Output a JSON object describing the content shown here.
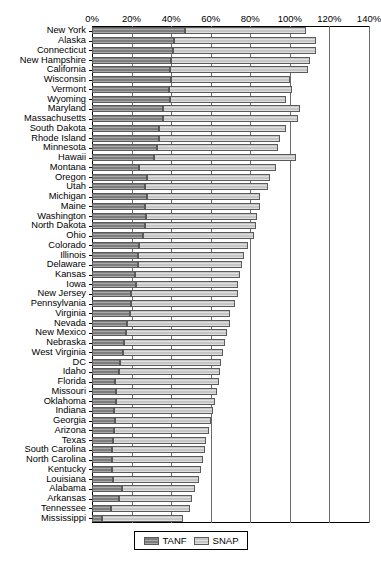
{
  "chart_data": {
    "type": "bar",
    "orientation": "horizontal",
    "stacked": true,
    "title": "",
    "xlabel": "",
    "ylabel": "",
    "xlim": [
      0,
      140
    ],
    "xticks": [
      0,
      20,
      40,
      60,
      80,
      100,
      120,
      140
    ],
    "xtick_labels": [
      "0%",
      "20%",
      "40%",
      "60%",
      "80%",
      "100%",
      "120%",
      "140%"
    ],
    "grid": true,
    "legend_position": "bottom-center",
    "legend": [
      "TANF",
      "SNAP"
    ],
    "series": [
      {
        "name": "TANF",
        "color": "#7d7d7d",
        "values": [
          47.0,
          41.5,
          41.0,
          40.0,
          39.5,
          40.0,
          39.0,
          39.5,
          36.0,
          36.0,
          34.0,
          34.0,
          33.0,
          31.5,
          24.0,
          28.0,
          27.0,
          28.0,
          27.0,
          27.5,
          27.0,
          26.0,
          24.0,
          23.0,
          23.0,
          21.5,
          22.0,
          19.5,
          19.5,
          19.0,
          17.5,
          17.0,
          16.0,
          15.5,
          14.0,
          13.5,
          11.5,
          12.0,
          12.0,
          11.0,
          11.5,
          11.0,
          10.5,
          10.0,
          10.0,
          10.0,
          10.5,
          15.0,
          13.5,
          9.5,
          5.0
        ]
      },
      {
        "name": "SNAP",
        "color": "#c6c6c6",
        "values": [
          61.0,
          71.5,
          72.0,
          70.0,
          69.5,
          60.0,
          62.0,
          58.5,
          69.0,
          68.0,
          64.0,
          61.0,
          61.0,
          71.5,
          69.0,
          62.0,
          62.0,
          57.0,
          58.0,
          56.0,
          56.0,
          56.0,
          55.0,
          54.0,
          53.0,
          53.5,
          52.0,
          54.5,
          53.0,
          51.0,
          52.0,
          51.0,
          51.0,
          50.5,
          51.0,
          51.0,
          52.5,
          51.0,
          50.0,
          50.0,
          48.5,
          48.0,
          47.0,
          47.0,
          46.0,
          45.0,
          43.5,
          37.0,
          37.0,
          40.0,
          41.0
        ]
      }
    ],
    "categories": [
      "New York",
      "Alaska",
      "Connecticut",
      "New Hampshire",
      "California",
      "Wisconsin",
      "Vermont",
      "Wyoming",
      "Maryland",
      "Massachusetts",
      "South Dakota",
      "Rhode Island",
      "Minnesota",
      "Hawaii",
      "Montana",
      "Oregon",
      "Utah",
      "Michigan",
      "Maine",
      "Washington",
      "North Dakota",
      "Ohio",
      "Colorado",
      "Illinois",
      "Delaware",
      "Kansas",
      "Iowa",
      "New Jersey",
      "Pennsylvania",
      "Virginia",
      "Nevada",
      "New Mexico",
      "Nebraska",
      "West Virginia",
      "DC",
      "Idaho",
      "Florida",
      "Missouri",
      "Oklahoma",
      "Indiana",
      "Georgia",
      "Arizona",
      "Texas",
      "South Carolina",
      "North Carolina",
      "Kentucky",
      "Louisiana",
      "Alabama",
      "Arkansas",
      "Tennessee",
      "Mississippi"
    ]
  },
  "legend": {
    "tanf_label": "TANF",
    "snap_label": "SNAP"
  },
  "colors": {
    "tanf": "#7d7d7d",
    "snap": "#c6c6c6",
    "axis": "#000000",
    "grid": "#6b6b6b",
    "background": "#ffffff"
  }
}
